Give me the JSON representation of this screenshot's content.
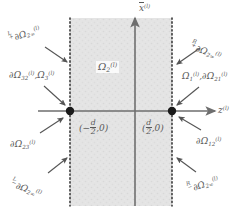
{
  "figure": {
    "background_color": "#ffffff",
    "slab_fill_color": "#e2e2e2",
    "line_color": "#6e6e6e",
    "node_color": "#1a1a1a",
    "text_color": "#585858"
  },
  "axes": {
    "vertical": {
      "symbol": "x",
      "superscript": "(l)",
      "overbar": true
    },
    "horizontal": {
      "symbol": "z",
      "superscript": "(l)"
    }
  },
  "region": {
    "interior_label": {
      "omega": "Ω",
      "sub": "2",
      "sup": "(l)"
    },
    "left_boundary_x": 70,
    "right_boundary_x": 172,
    "axis_y": 111
  },
  "points": [
    {
      "name": "left-node",
      "label_minus": "(−",
      "d": "d",
      "two": "2",
      "zero": ",0)"
    },
    {
      "name": "right-node",
      "label_open": "(",
      "d": "d",
      "two": "2",
      "zero": ",0)"
    }
  ],
  "labels": {
    "top_left": {
      "presup": "L",
      "presub": "+",
      "d": "∂",
      "omega": "Ω",
      "sub": "2∞",
      "sup": "(l)"
    },
    "mid_left": {
      "d": "∂",
      "omega": "Ω",
      "sub": "32",
      "sup": "(l)",
      "sep": ",",
      "omega2": "Ω",
      "sub2": "3",
      "sup2": "(l)"
    },
    "low_left": {
      "d": "∂",
      "omega": "Ω",
      "sub": "23",
      "sup": "(l)"
    },
    "bottom_left": {
      "presup": "L",
      "presub": "−",
      "d": "∂",
      "omega": "Ω",
      "sub": "2∞",
      "sup": "(l)"
    },
    "top_right": {
      "presup": "R",
      "presub": "+",
      "d": "∂",
      "omega": "Ω",
      "sub": "2∞",
      "sup": "(l)"
    },
    "mid_right": {
      "omega": "Ω",
      "sub": "1",
      "sup": "(l)",
      "sep": ",",
      "d": "∂",
      "omega2": "Ω",
      "sub2": "21",
      "sup2": "(l)"
    },
    "low_right": {
      "d": "∂",
      "omega": "Ω",
      "sub": "12",
      "sup": "(l)"
    },
    "bottom_right": {
      "presup": "R",
      "presub": "−",
      "d": "∂",
      "omega": "Ω",
      "sub": "2∞",
      "sup": "(l)"
    }
  }
}
